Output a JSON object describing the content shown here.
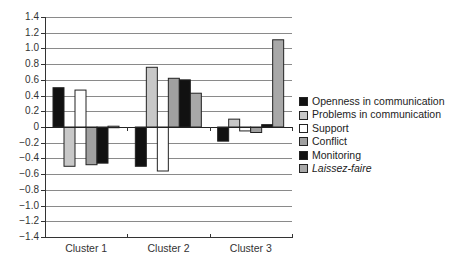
{
  "chart_data": {
    "type": "bar",
    "title": "",
    "xlabel": "",
    "ylabel": "",
    "categories": [
      "Cluster 1",
      "Cluster 2",
      "Cluster 3"
    ],
    "ylim": [
      -1.4,
      1.4
    ],
    "yticks": [
      "1.4",
      "1.2",
      "1.0",
      "0.8",
      "0.6",
      "0.4",
      "0.2",
      "0",
      "−0.2",
      "−0.4",
      "−0.6",
      "−0.8",
      "−1.0",
      "−1.2",
      "−1.4"
    ],
    "ytick_values": [
      1.4,
      1.2,
      1.0,
      0.8,
      0.6,
      0.4,
      0.2,
      0,
      -0.2,
      -0.4,
      -0.6,
      -0.8,
      -1.0,
      -1.2,
      -1.4
    ],
    "grid": true,
    "legend_position": "right",
    "series": [
      {
        "name": "Openness in communication",
        "values": [
          0.5,
          -0.5,
          -0.18
        ],
        "color": "#111111",
        "italic": false
      },
      {
        "name": "Problems in communication",
        "values": [
          -0.5,
          0.76,
          0.1
        ],
        "color": "#c8c8c8",
        "italic": false
      },
      {
        "name": "Support",
        "values": [
          0.47,
          -0.56,
          -0.05
        ],
        "color": "#ffffff",
        "italic": false
      },
      {
        "name": "Conflict",
        "values": [
          -0.48,
          0.62,
          -0.07
        ],
        "color": "#a0a0a0",
        "italic": false
      },
      {
        "name": "Monitoring",
        "values": [
          -0.46,
          0.6,
          0.03
        ],
        "color": "#111111",
        "italic": false
      },
      {
        "name": "Laissez-faire",
        "values": [
          0.01,
          0.43,
          1.11
        ],
        "color": "#a8a8a8",
        "italic": true
      }
    ]
  }
}
